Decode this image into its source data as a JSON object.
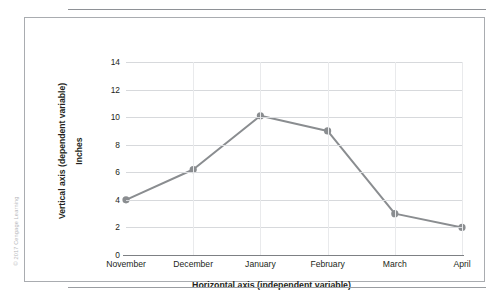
{
  "figure": {
    "copyright": "© 2017 Cengage Learning"
  },
  "chart_data": {
    "type": "line",
    "title": "",
    "xlabel": "Horizontal axis (independent variable)",
    "ylabel": "Vertical axis (dependent variable)",
    "yunit": "Inches",
    "categories": [
      "November",
      "December",
      "January",
      "February",
      "March",
      "April"
    ],
    "values": [
      4,
      6.2,
      10.1,
      9,
      3,
      2
    ],
    "ylim": [
      0,
      14
    ],
    "yticks": [
      0,
      2,
      4,
      6,
      8,
      10,
      12,
      14
    ],
    "ytick_labels": [
      "0",
      "2",
      "4",
      "6",
      "8",
      "10",
      "12",
      "14"
    ],
    "grid": true,
    "legend": "none",
    "series_color": "#8a8d90",
    "marker": "circle",
    "marker_color": "#8a8d90"
  }
}
